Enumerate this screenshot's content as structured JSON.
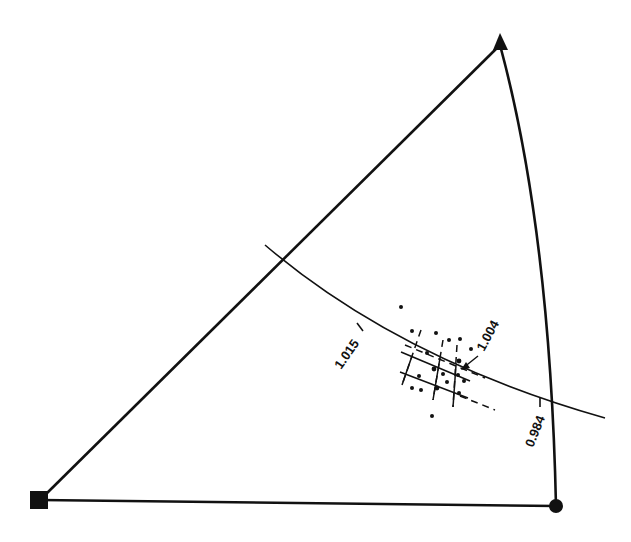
{
  "diagram": {
    "type": "ternary-sector-diagram",
    "vertices": {
      "apex": {
        "shape": "triangle",
        "icon": "triangle-marker"
      },
      "bottom_left": {
        "shape": "square",
        "icon": "square-marker"
      },
      "bottom_right": {
        "shape": "circle",
        "icon": "circle-marker"
      }
    },
    "labels": {
      "left_tick": "1.015",
      "center_tick": "1.004",
      "right_tick": "0.984"
    },
    "colors": {
      "line": "#111111",
      "background": "#ffffff"
    }
  }
}
